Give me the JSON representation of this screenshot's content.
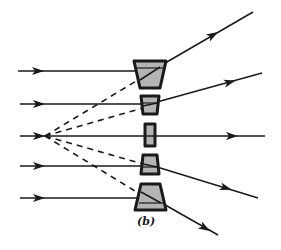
{
  "figure": {
    "label": "(b)",
    "colors": {
      "ink": "#1a1a1a",
      "prism_fill": "#b4b4b4",
      "background": "#ffffff"
    },
    "virtual_focus": {
      "x": 45,
      "y": 136
    },
    "rays": [
      {
        "id": "ray-1",
        "y_in": 71,
        "x_start": 18,
        "x_lens": 140,
        "exit": {
          "x1": 162,
          "y1": 68,
          "x2": 253,
          "y2": 12
        }
      },
      {
        "id": "ray-2",
        "y_in": 104,
        "x_start": 20,
        "x_lens": 143,
        "exit": {
          "x1": 157,
          "y1": 104,
          "x2": 262,
          "y2": 73
        }
      },
      {
        "id": "ray-3",
        "y_in": 136,
        "x_start": 20,
        "x_lens": 147,
        "exit": {
          "x1": 153,
          "y1": 136,
          "x2": 265,
          "y2": 136
        }
      },
      {
        "id": "ray-4",
        "y_in": 166,
        "x_start": 20,
        "x_lens": 143,
        "exit": {
          "x1": 157,
          "y1": 167,
          "x2": 258,
          "y2": 198
        }
      },
      {
        "id": "ray-5",
        "y_in": 198,
        "x_start": 20,
        "x_lens": 140,
        "exit": {
          "x1": 162,
          "y1": 202,
          "x2": 218,
          "y2": 235
        }
      }
    ],
    "prisms": [
      {
        "id": "prism-1",
        "points": "134,61 166,61 160,88 140,88"
      },
      {
        "id": "prism-2",
        "points": "141,96 159,96 157,114 143,114"
      },
      {
        "id": "prism-3",
        "points": "145,124 155,124 155,146 145,146"
      },
      {
        "id": "prism-4",
        "points": "143,155 157,155 159,174 141,174"
      },
      {
        "id": "prism-5",
        "points": "141,184 160,184 166,210 135,210"
      }
    ]
  }
}
